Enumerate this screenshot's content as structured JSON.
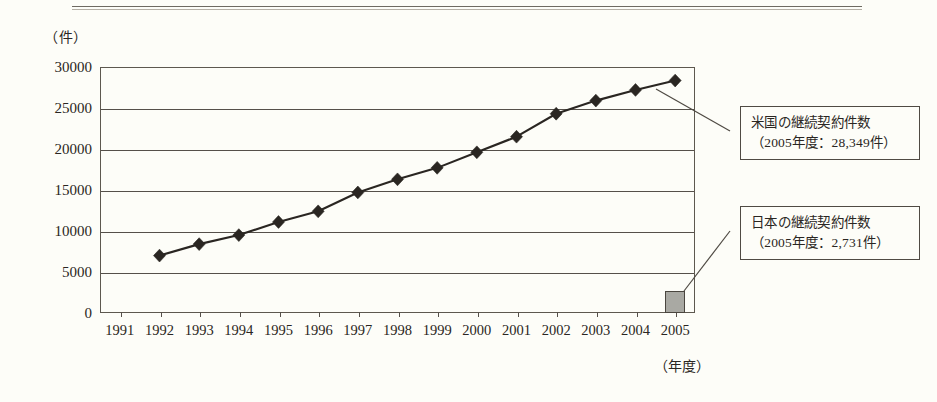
{
  "y_axis_unit": "（件）",
  "x_axis_unit": "（年度）",
  "annotations": [
    {
      "name": "us-callout",
      "line1": "米国の継続契約件数",
      "line2": "（2005年度：28,349件）"
    },
    {
      "name": "japan-callout",
      "line1": "日本の継続契約件数",
      "line2": "（2005年度：2,731件）"
    }
  ],
  "chart_data": {
    "type": "line",
    "title": "",
    "xlabel": "（年度）",
    "ylabel": "（件）",
    "ylim": [
      0,
      30000
    ],
    "ytick_labels": [
      "30000",
      "25000",
      "20000",
      "15000",
      "10000",
      "5000",
      "0"
    ],
    "yticks": [
      30000,
      25000,
      20000,
      15000,
      10000,
      5000,
      0
    ],
    "grid": true,
    "legend": "none",
    "categories": [
      "1991",
      "1992",
      "1993",
      "1994",
      "1995",
      "1996",
      "1997",
      "1998",
      "1999",
      "2000",
      "2001",
      "2002",
      "2003",
      "2004",
      "2005"
    ],
    "series": [
      {
        "name": "米国の継続契約件数",
        "type": "line",
        "marker": "diamond",
        "color": "#2a2622",
        "values": [
          null,
          7000,
          8400,
          9500,
          11100,
          12400,
          14700,
          16300,
          17700,
          19600,
          21500,
          24300,
          25900,
          27200,
          28349
        ]
      },
      {
        "name": "日本の継続契約件数",
        "type": "bar",
        "color": "#a9a9a3",
        "values": [
          null,
          null,
          null,
          null,
          null,
          null,
          null,
          null,
          null,
          null,
          null,
          null,
          null,
          null,
          2731
        ]
      }
    ]
  }
}
